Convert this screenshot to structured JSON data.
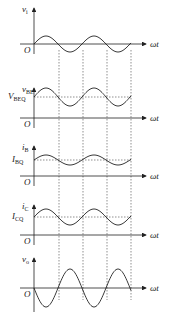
{
  "diagram": {
    "type": "waveform-stack",
    "x_axis_label": "ωt",
    "origin_label": "O",
    "panels": [
      {
        "id": "vi",
        "var": "v",
        "sub": "i",
        "q_var": "",
        "q_sub": "",
        "axis_y": 44,
        "dc": 0,
        "amp": 8,
        "phase": 0
      },
      {
        "id": "vbe",
        "var": "v",
        "sub": "BE",
        "q_var": "V",
        "q_sub": "BEQ",
        "axis_y": 118,
        "dc": -21,
        "amp": 9,
        "phase": 0
      },
      {
        "id": "ib",
        "var": "i",
        "sub": "B",
        "q_var": "I",
        "q_sub": "BQ",
        "axis_y": 176,
        "dc": -16,
        "amp": 5,
        "phase": 0
      },
      {
        "id": "ic",
        "var": "i",
        "sub": "C",
        "q_var": "I",
        "q_sub": "CQ",
        "axis_y": 235,
        "dc": -18,
        "amp": 8,
        "phase": 0
      },
      {
        "id": "vo",
        "var": "v",
        "sub": "o",
        "q_var": "",
        "q_sub": "",
        "axis_y": 288,
        "dc": 0,
        "amp": 19,
        "phase": 1
      }
    ],
    "dashed_x": [
      59,
      83,
      107,
      131
    ]
  }
}
